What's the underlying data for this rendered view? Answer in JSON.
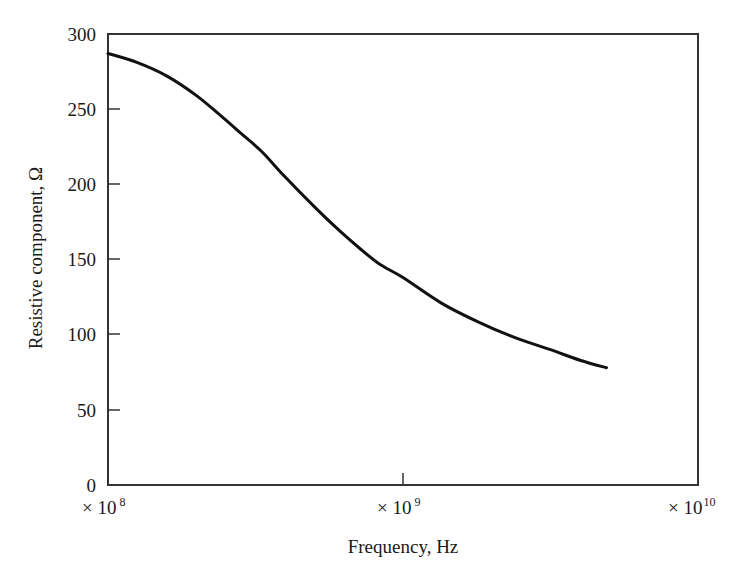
{
  "chart_data": {
    "type": "line",
    "title": "",
    "xlabel": "Frequency, Hz",
    "ylabel": "Resistive component, Ω",
    "xscale": "log",
    "xlim": [
      100000000,
      10000000000
    ],
    "ylim": [
      0,
      300
    ],
    "grid": false,
    "legend": null,
    "y_ticks": [
      0,
      50,
      100,
      150,
      200,
      250,
      300
    ],
    "y_tick_labels": [
      "0",
      "50",
      "100",
      "150",
      "200",
      "250",
      "300"
    ],
    "x_ticks": [
      100000000,
      1000000000,
      10000000000
    ],
    "x_tick_labels": [
      {
        "prefix": "× 10",
        "exp": "8"
      },
      {
        "prefix": "× 10",
        "exp": "9"
      },
      {
        "prefix": "× 10",
        "exp": "10"
      }
    ],
    "series": [
      {
        "name": "Resistive component",
        "color": "#111111",
        "log10_x": [
          8.0,
          8.1,
          8.2,
          8.3,
          8.38,
          8.45,
          8.52,
          8.6,
          8.7,
          8.78,
          8.85,
          8.92,
          9.0,
          9.13,
          9.26,
          9.38,
          9.5,
          9.6,
          9.69
        ],
        "x": [
          100000000,
          125900000,
          158500000,
          199500000,
          239900000,
          281800000,
          331100000,
          398100000,
          501200000,
          602600000,
          707900000,
          831800000,
          1000000000,
          1349000000,
          1820000000,
          2399000000,
          3162000000,
          3981000000,
          4898000000
        ],
        "y": [
          287,
          281,
          272,
          259,
          246,
          234,
          222,
          205,
          185,
          170,
          158,
          147,
          138,
          121,
          108,
          98,
          90,
          83,
          78
        ]
      }
    ]
  },
  "labels": {
    "xlabel": "Frequency, Hz",
    "ylabel": "Resistive component, Ω",
    "y0": "0",
    "y50": "50",
    "y100": "100",
    "y150": "150",
    "y200": "200",
    "y250": "250",
    "y300": "300",
    "x8_prefix": "× 10",
    "x8_exp": "8",
    "x9_prefix": "× 10",
    "x9_exp": "9",
    "x10_prefix": "× 10",
    "x10_exp": "10"
  }
}
